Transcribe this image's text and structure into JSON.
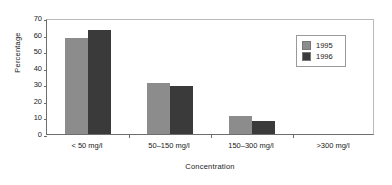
{
  "chart_data": {
    "type": "bar",
    "title": "",
    "xlabel": "Concentration",
    "ylabel": "Percentage",
    "categories": [
      "< 50 mg/l",
      "50–150 mg/l",
      "150–300 mg/l",
      ">300 mg/l"
    ],
    "series": [
      {
        "name": "1995",
        "color": "#8c8c8c",
        "values": [
          58,
          31,
          11,
          0
        ]
      },
      {
        "name": "1996",
        "color": "#3a3a3a",
        "values": [
          63,
          29,
          8,
          0
        ]
      }
    ],
    "ylim": [
      0,
      70
    ],
    "yticks": [
      0,
      10,
      20,
      30,
      40,
      50,
      60,
      70
    ],
    "ytick_labels": [
      "0",
      "10",
      "20",
      "30",
      "40",
      "50",
      "60",
      "70"
    ],
    "grid": false,
    "legend_position": "top-right",
    "legend_entries": [
      "1995",
      "1996"
    ]
  },
  "axes": {
    "y_title": "Percentage",
    "x_title": "Concentration"
  }
}
